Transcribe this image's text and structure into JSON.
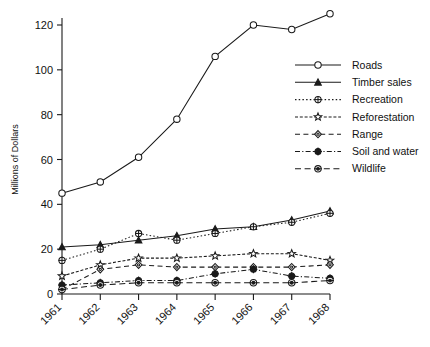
{
  "chart_data": {
    "type": "line",
    "title": "",
    "xlabel": "",
    "ylabel": "Millions of Dollars",
    "categories": [
      "1961",
      "1962",
      "1963",
      "1964",
      "1965",
      "1966",
      "1967",
      "1968"
    ],
    "x": [
      1961,
      1962,
      1963,
      1964,
      1965,
      1966,
      1967,
      1968
    ],
    "ylim": [
      0,
      130
    ],
    "yticks": [
      0,
      20,
      40,
      60,
      80,
      100,
      120
    ],
    "ytick_labels": [
      "0",
      "20",
      "40",
      "60",
      "80",
      "100",
      "120"
    ],
    "xlim": [
      1960.6,
      1968.4
    ],
    "grid": false,
    "legend_position": "right-upper",
    "series": [
      {
        "name": "Roads",
        "marker": "open-circle",
        "dash": "solid",
        "values": [
          45,
          50,
          61,
          78,
          106,
          120,
          118,
          125
        ]
      },
      {
        "name": "Timber sales",
        "marker": "filled-triangle",
        "dash": "solid",
        "values": [
          21,
          22,
          24,
          26,
          29,
          30,
          33,
          37
        ]
      },
      {
        "name": "Recreation",
        "marker": "circle-cross",
        "dash": "dotted",
        "values": [
          15,
          20,
          27,
          24,
          27,
          30,
          32,
          36
        ]
      },
      {
        "name": "Reforestation",
        "marker": "star",
        "dash": "dense-dash",
        "values": [
          8,
          13,
          16,
          16,
          17,
          18,
          18,
          15
        ]
      },
      {
        "name": "Range",
        "marker": "open-diamond",
        "dash": "dashed",
        "values": [
          2,
          11,
          13,
          12,
          12,
          12,
          12,
          13
        ]
      },
      {
        "name": "Soil and water",
        "marker": "filled-circle-cross",
        "dash": "dash-dot",
        "values": [
          4,
          5,
          6,
          6,
          9,
          11,
          8,
          7
        ]
      },
      {
        "name": "Wildlife",
        "marker": "circle-dot",
        "dash": "long-dash",
        "values": [
          2,
          4,
          5,
          5,
          5,
          5,
          5,
          6
        ]
      }
    ]
  },
  "axes": {
    "ylabel": "Millions of Dollars"
  },
  "legend": {
    "items": [
      {
        "label": "Roads"
      },
      {
        "label": "Timber sales"
      },
      {
        "label": "Recreation"
      },
      {
        "label": "Reforestation"
      },
      {
        "label": "Range"
      },
      {
        "label": "Soil and water"
      },
      {
        "label": "Wildlife"
      }
    ]
  }
}
